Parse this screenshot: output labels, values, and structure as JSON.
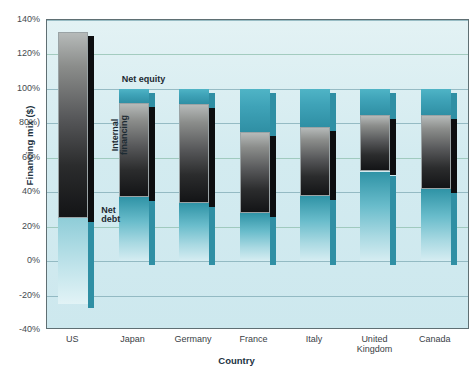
{
  "chart_data": {
    "type": "bar",
    "title": "",
    "xlabel": "Country",
    "ylabel": "Financing mix ($)",
    "ylim": [
      -40,
      140
    ],
    "ytick_labels": [
      "140%",
      "120%",
      "100%",
      "80%)",
      "60%",
      "40%",
      "20%",
      "0%",
      "-20%",
      "-40%"
    ],
    "ytick_values": [
      140,
      120,
      100,
      80,
      60,
      40,
      20,
      0,
      -20,
      -40
    ],
    "grid": true,
    "legend_position": "inline-annotations",
    "categories": [
      "US",
      "Japan",
      "Germany",
      "France",
      "Italy",
      "United\nKingdom",
      "Canada"
    ],
    "series": [
      {
        "name": "Net equity",
        "values": [
          0,
          8,
          9,
          25,
          22,
          15,
          15
        ]
      },
      {
        "name": "Internal financing",
        "values": [
          108,
          55,
          57,
          47,
          40,
          33,
          43
        ]
      },
      {
        "name": "Net debt",
        "values": [
          -50,
          37,
          34,
          28,
          38,
          52,
          42
        ]
      }
    ],
    "segments": [
      {
        "category": "US",
        "equity_top": 133,
        "equity_bottom": 133,
        "internal_top": 133,
        "internal_bottom": 25,
        "debt_top": 25,
        "debt_bottom": -25
      },
      {
        "category": "Japan",
        "equity_top": 100,
        "equity_bottom": 92,
        "internal_top": 92,
        "internal_bottom": 37,
        "debt_top": 37,
        "debt_bottom": 0
      },
      {
        "category": "Germany",
        "equity_top": 100,
        "equity_bottom": 91,
        "internal_top": 91,
        "internal_bottom": 34,
        "debt_top": 34,
        "debt_bottom": 0
      },
      {
        "category": "France",
        "equity_top": 100,
        "equity_bottom": 75,
        "internal_top": 75,
        "internal_bottom": 28,
        "debt_top": 28,
        "debt_bottom": 0
      },
      {
        "category": "Italy",
        "equity_top": 100,
        "equity_bottom": 78,
        "internal_top": 78,
        "internal_bottom": 38,
        "debt_top": 38,
        "debt_bottom": 0
      },
      {
        "category": "United Kingdom",
        "equity_top": 100,
        "equity_bottom": 85,
        "internal_top": 85,
        "internal_bottom": 52,
        "debt_top": 52,
        "debt_bottom": 0
      },
      {
        "category": "Canada",
        "equity_top": 100,
        "equity_bottom": 85,
        "internal_top": 85,
        "internal_bottom": 42,
        "debt_top": 42,
        "debt_bottom": 0
      }
    ],
    "annotations": [
      {
        "name": "net-equity",
        "text": "Net equity"
      },
      {
        "name": "internal-financing",
        "text": "Internal\nfinancing"
      },
      {
        "name": "net-debt",
        "text": "Net\ndebt"
      }
    ],
    "colors": {
      "plot_background": "#d3ebf0",
      "gridline": "#7fa9b4",
      "net_equity": "#3fa3b8",
      "internal_financing": "#3a3b3d",
      "net_debt": "#69bccb",
      "axis_text": "#23333f"
    }
  }
}
